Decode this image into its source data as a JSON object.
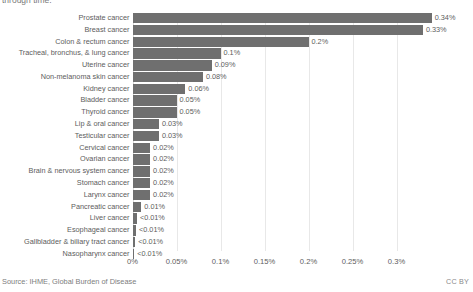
{
  "subtitle_fragment": "through time.",
  "footer": {
    "source": "Source: IHME, Global Burden of Disease",
    "license": "CC BY"
  },
  "chart_data": {
    "type": "bar",
    "orientation": "horizontal",
    "title": "",
    "subtitle_fragment": "through time.",
    "xlabel": "",
    "ylabel": "",
    "xlim": [
      0,
      0.34
    ],
    "grid": "vertical",
    "legend": "none",
    "bar_color": "#6f6f6f",
    "axis_ticks": [
      "0%",
      "0.05%",
      "0.1%",
      "0.15%",
      "0.2%",
      "0.25%",
      "0.3%"
    ],
    "axis_tick_values": [
      0,
      0.05,
      0.1,
      0.15,
      0.2,
      0.25,
      0.3
    ],
    "categories": [
      "Prostate cancer",
      "Breast cancer",
      "Colon & rectum cancer",
      "Tracheal, bronchus, & lung cancer",
      "Uterine cancer",
      "Non-melanoma skin cancer",
      "Kidney cancer",
      "Bladder cancer",
      "Thyroid cancer",
      "Lip & oral cancer",
      "Testicular cancer",
      "Cervical cancer",
      "Ovarian cancer",
      "Brain & nervous system cancer",
      "Stomach cancer",
      "Larynx cancer",
      "Pancreatic cancer",
      "Liver cancer",
      "Esophageal cancer",
      "Gallbladder & biliary tract cancer",
      "Nasopharynx cancer"
    ],
    "values": [
      0.34,
      0.33,
      0.2,
      0.1,
      0.09,
      0.08,
      0.06,
      0.05,
      0.05,
      0.03,
      0.03,
      0.02,
      0.02,
      0.02,
      0.02,
      0.02,
      0.01,
      0.005,
      0.004,
      0.003,
      0.002
    ],
    "value_labels": [
      "0.34%",
      "0.33%",
      "0.2%",
      "0.1%",
      "0.09%",
      "0.08%",
      "0.06%",
      "0.05%",
      "0.05%",
      "0.03%",
      "0.03%",
      "0.02%",
      "0.02%",
      "0.02%",
      "0.02%",
      "0.02%",
      "0.01%",
      "<0.01%",
      "<0.01%",
      "<0.01%",
      "<0.01%"
    ]
  }
}
